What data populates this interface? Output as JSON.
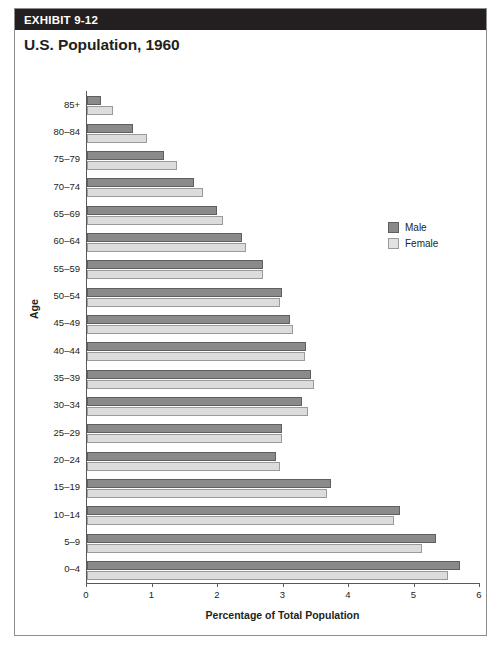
{
  "exhibit": {
    "banner_label": "EXHIBIT 9-12",
    "title": "U.S. Population, 1960"
  },
  "legend": {
    "position": "top-right",
    "items": [
      {
        "label": "Male",
        "color": "#8a8a8a"
      },
      {
        "label": "Female",
        "color": "#dcdcdc"
      }
    ]
  },
  "colors": {
    "banner_background": "#231f20",
    "banner_text": "#ffffff",
    "male_bar": "#8a8a8a",
    "female_bar": "#dcdcdc",
    "axis": "#58595b",
    "card_border": "#8d8d8d"
  },
  "source_note": "",
  "chart_data": {
    "type": "bar",
    "orientation": "horizontal",
    "title": "U.S. Population, 1960",
    "xlabel": "Percentage of Total Population",
    "ylabel": "Age",
    "xlim": [
      0,
      6
    ],
    "ylim": null,
    "grid": false,
    "xticks": [
      0,
      1,
      2,
      3,
      4,
      5,
      6
    ],
    "xtick_labels": [
      "0",
      "1",
      "2",
      "3",
      "4",
      "5",
      "6"
    ],
    "legend_position": "upper right",
    "categories": [
      "0–4",
      "5–9",
      "10–14",
      "15–19",
      "20–24",
      "25–29",
      "30–34",
      "35–39",
      "40–44",
      "45–49",
      "50–54",
      "55–59",
      "60–64",
      "65–69",
      "70–74",
      "75–79",
      "80–84",
      "85+"
    ],
    "series": [
      {
        "name": "Male",
        "color": "#8a8a8a",
        "values": [
          5.7,
          5.33,
          4.78,
          3.72,
          2.88,
          2.97,
          3.28,
          3.42,
          3.34,
          3.1,
          2.98,
          2.68,
          2.36,
          1.98,
          1.64,
          1.18,
          0.7,
          0.22
        ]
      },
      {
        "name": "Female",
        "color": "#dcdcdc",
        "values": [
          5.51,
          5.11,
          4.69,
          3.66,
          2.95,
          2.98,
          3.37,
          3.47,
          3.33,
          3.14,
          2.95,
          2.69,
          2.42,
          2.07,
          1.77,
          1.38,
          0.91,
          0.4
        ]
      }
    ]
  }
}
